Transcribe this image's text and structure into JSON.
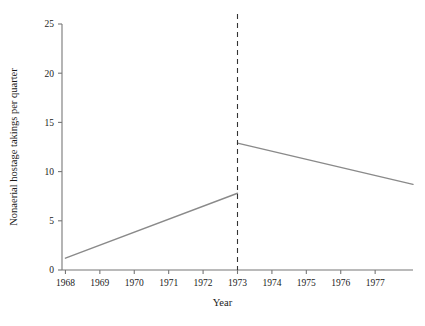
{
  "chart_data": {
    "type": "scatter",
    "title": "",
    "xlabel": "Year",
    "ylabel": "Nonaerial hostage takings per quarter",
    "xlim": [
      1967.9,
      1978.1
    ],
    "ylim": [
      0,
      25
    ],
    "xticks": [
      1968,
      1969,
      1970,
      1971,
      1972,
      1973,
      1974,
      1975,
      1976,
      1977
    ],
    "xtick_labels": [
      "1968",
      "1969",
      "1970",
      "1971",
      "1972",
      "1973",
      "1974",
      "1975",
      "1976",
      "1977"
    ],
    "yticks": [
      0,
      5,
      10,
      15,
      20,
      25
    ],
    "ytick_labels": [
      "0",
      "5",
      "10",
      "15",
      "20",
      "25"
    ],
    "grid": false,
    "legend": null,
    "point_color": "#111111",
    "trend_color": "#8a8a8a",
    "intervention_color": "#333333",
    "series": [
      {
        "name": "Nonaerial hostage takings per quarter",
        "marker": "filled-circle",
        "points": [
          {
            "x": 1968.1,
            "y": 0
          },
          {
            "x": 1968.35,
            "y": 0
          },
          {
            "x": 1968.6,
            "y": 1
          },
          {
            "x": 1968.88,
            "y": 0
          },
          {
            "x": 1969.1,
            "y": 0
          },
          {
            "x": 1969.35,
            "y": 0
          },
          {
            "x": 1969.62,
            "y": 2
          },
          {
            "x": 1969.88,
            "y": 1
          },
          {
            "x": 1970.12,
            "y": 10
          },
          {
            "x": 1970.38,
            "y": 11
          },
          {
            "x": 1970.62,
            "y": 15
          },
          {
            "x": 1970.88,
            "y": 8
          },
          {
            "x": 1971.12,
            "y": 7
          },
          {
            "x": 1971.35,
            "y": 7
          },
          {
            "x": 1971.6,
            "y": 9
          },
          {
            "x": 1971.88,
            "y": 3
          },
          {
            "x": 1972.1,
            "y": 2
          },
          {
            "x": 1972.35,
            "y": 1
          },
          {
            "x": 1972.62,
            "y": 6
          },
          {
            "x": 1972.88,
            "y": 7
          },
          {
            "x": 1973.1,
            "y": 10
          },
          {
            "x": 1973.35,
            "y": 14
          },
          {
            "x": 1973.62,
            "y": 9
          },
          {
            "x": 1973.85,
            "y": 15
          },
          {
            "x": 1974.12,
            "y": 11
          },
          {
            "x": 1974.35,
            "y": 11
          },
          {
            "x": 1974.6,
            "y": 12
          },
          {
            "x": 1974.88,
            "y": 8
          },
          {
            "x": 1975.12,
            "y": 9
          },
          {
            "x": 1975.35,
            "y": 8
          },
          {
            "x": 1975.6,
            "y": 18
          },
          {
            "x": 1975.88,
            "y": 24
          },
          {
            "x": 1976.12,
            "y": 7
          },
          {
            "x": 1976.38,
            "y": 12
          },
          {
            "x": 1976.62,
            "y": 11
          },
          {
            "x": 1976.88,
            "y": 4
          },
          {
            "x": 1977.12,
            "y": 8
          },
          {
            "x": 1977.38,
            "y": 12
          },
          {
            "x": 1977.62,
            "y": 6
          },
          {
            "x": 1977.85,
            "y": 6
          }
        ]
      }
    ],
    "trend_lines": [
      {
        "name": "pre-intervention-trend",
        "x0": 1968.0,
        "y0": 1.2,
        "x1": 1973.0,
        "y1": 7.8
      },
      {
        "name": "post-intervention-trend",
        "x0": 1973.0,
        "y0": 12.9,
        "x1": 1978.1,
        "y1": 8.7
      }
    ],
    "intervention": {
      "name": "intervention-marker",
      "x": 1973.0,
      "style": "dashed-vertical",
      "label": "1973"
    }
  }
}
